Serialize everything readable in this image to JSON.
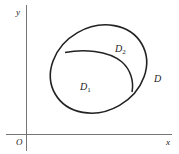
{
  "diagram": {
    "type": "region-plot",
    "axes": {
      "x_label": "x",
      "y_label": "y",
      "origin_label": "O",
      "stroke_color": "#555555"
    },
    "regions": [
      {
        "id": "D",
        "label": "D",
        "sub": ""
      },
      {
        "id": "D1",
        "label": "D",
        "sub": "1"
      },
      {
        "id": "D2",
        "label": "D",
        "sub": "2"
      }
    ],
    "curve_color": "#222222"
  }
}
